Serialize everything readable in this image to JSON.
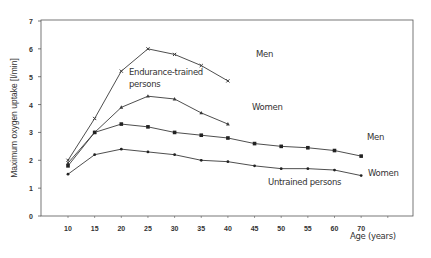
{
  "chart_data": {
    "type": "line",
    "title": "",
    "xlabel": "Age (years)",
    "ylabel": "Maximum oxygen uptake [l/min]",
    "ylim": [
      0,
      7
    ],
    "yticks": [
      0,
      1,
      2,
      3,
      4,
      5,
      6,
      7
    ],
    "x": [
      10,
      15,
      20,
      25,
      30,
      35,
      40,
      45,
      50,
      55,
      60,
      70
    ],
    "grid": false,
    "legend": "inline annotations",
    "series": [
      {
        "name": "Endurance-trained persons - Men",
        "marker": "x",
        "x": [
          10,
          15,
          20,
          25,
          30,
          35,
          40
        ],
        "values": [
          2.0,
          3.5,
          5.2,
          6.0,
          5.8,
          5.4,
          4.85
        ]
      },
      {
        "name": "Endurance-trained persons - Women",
        "marker": "triangle",
        "x": [
          10,
          15,
          20,
          25,
          30,
          35,
          40
        ],
        "values": [
          1.9,
          3.0,
          3.9,
          4.3,
          4.2,
          3.7,
          3.3
        ]
      },
      {
        "name": "Untrained persons - Men",
        "marker": "square",
        "x": [
          10,
          15,
          20,
          25,
          30,
          35,
          40,
          45,
          50,
          55,
          60,
          70
        ],
        "values": [
          1.8,
          3.0,
          3.3,
          3.2,
          3.0,
          2.9,
          2.8,
          2.6,
          2.5,
          2.45,
          2.35,
          2.15
        ]
      },
      {
        "name": "Untrained persons - Women",
        "marker": "dot",
        "x": [
          10,
          15,
          20,
          25,
          30,
          35,
          40,
          45,
          50,
          55,
          60,
          70
        ],
        "values": [
          1.5,
          2.2,
          2.4,
          2.3,
          2.2,
          2.0,
          1.95,
          1.8,
          1.7,
          1.7,
          1.65,
          1.45
        ]
      }
    ],
    "annotations": [
      {
        "text": "Men",
        "series": "trained-men"
      },
      {
        "text": "Endurance-trained",
        "line2": "persons"
      },
      {
        "text": "Women",
        "series": "trained-women"
      },
      {
        "text": "Men",
        "series": "untrained-men"
      },
      {
        "text": "Women",
        "series": "untrained-women"
      },
      {
        "text": "Untrained persons"
      }
    ]
  },
  "labels": {
    "ylabel": "Maximum oxygen uptake [l/min]",
    "xlabel": "Age (years)",
    "trained_men": "Men",
    "trained_group_1": "Endurance-trained",
    "trained_group_2": "persons",
    "trained_women": "Women",
    "untrained_men": "Men",
    "untrained_women": "Women",
    "untrained_group": "Untrained persons"
  },
  "colors": {
    "line": "#3a3a3a",
    "axis": "#555555",
    "text": "#333333"
  }
}
